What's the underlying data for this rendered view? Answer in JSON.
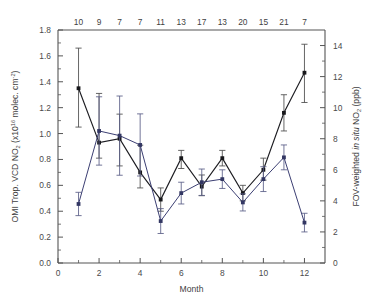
{
  "figure": {
    "xlabel": "Month",
    "left_axis_title_parts": {
      "p1": "OMI Trop. VCD NO",
      "sub1": "2",
      "p2": " (x10",
      "sup1": "16",
      "p3": " molec. cm",
      "sup2": "-2",
      "p4": ")"
    },
    "right_axis_title_parts": {
      "p1": "FOV-weighted ",
      "ital": "in situ",
      "p2": " NO",
      "sub1": "2",
      "p3": " (ppb)"
    },
    "colors": {
      "series_a": "#17171b",
      "series_b": "#333763",
      "axis": "#555555",
      "background": "#ffffff"
    }
  },
  "chart_data": {
    "type": "line",
    "title": "",
    "xlabel": "Month",
    "ylabel": "OMI Trop. VCD NO2 (x10^16 molec. cm^-2)",
    "y2label": "FOV-weighted in situ NO2 (ppb)",
    "grid": false,
    "legend": "none",
    "x": [
      1,
      2,
      3,
      4,
      5,
      6,
      7,
      8,
      9,
      10,
      11,
      12
    ],
    "xlim": [
      0,
      13
    ],
    "xticks": [
      0,
      2,
      4,
      6,
      8,
      10,
      12
    ],
    "xticklabels": [
      "0",
      "2",
      "4",
      "6",
      "8",
      "10",
      "12"
    ],
    "ylim": [
      0.0,
      1.8
    ],
    "yticks": [
      0.0,
      0.2,
      0.4,
      0.6,
      0.8,
      1.0,
      1.2,
      1.4,
      1.6,
      1.8
    ],
    "yticklabels": [
      "0.0",
      "0.2",
      "0.4",
      "0.6",
      "0.8",
      "1.0",
      "1.2",
      "1.4",
      "1.6",
      "1.8"
    ],
    "y2lim": [
      0,
      15
    ],
    "y2ticks": [
      0,
      2,
      4,
      6,
      8,
      10,
      12,
      14
    ],
    "y2ticklabels": [
      "0",
      "2",
      "4",
      "6",
      "8",
      "10",
      "12",
      "14"
    ],
    "top_axis_label": "number of observations",
    "top_axis_values": [
      10,
      9,
      7,
      7,
      11,
      13,
      17,
      13,
      20,
      15,
      21,
      7
    ],
    "series": [
      {
        "name": "OMI Trop. VCD NO2",
        "axis": "left",
        "color": "#17171b",
        "marker": "square",
        "values": [
          1.35,
          0.93,
          0.96,
          0.7,
          0.49,
          0.81,
          0.59,
          0.81,
          0.54,
          0.72,
          1.16,
          1.47
        ],
        "err_low": [
          0.3,
          0.12,
          0.21,
          0.12,
          0.09,
          0.08,
          0.07,
          0.06,
          0.06,
          0.08,
          0.14,
          0.23
        ],
        "err_high": [
          0.31,
          0.38,
          0.19,
          0.21,
          0.09,
          0.06,
          0.09,
          0.06,
          0.06,
          0.09,
          0.14,
          0.22
        ]
      },
      {
        "name": "FOV-weighted in situ NO2",
        "axis": "right",
        "color": "#333763",
        "marker": "square",
        "values": [
          3.8,
          8.5,
          8.2,
          7.6,
          2.7,
          4.5,
          5.2,
          5.4,
          3.9,
          5.4,
          6.8,
          2.6
        ],
        "err_low": [
          0.75,
          2.2,
          2.55,
          2.0,
          0.8,
          0.7,
          0.85,
          0.6,
          0.55,
          0.8,
          0.8,
          0.6
        ],
        "err_high": [
          0.75,
          2.2,
          2.55,
          2.0,
          0.8,
          0.7,
          0.85,
          0.6,
          0.55,
          0.8,
          0.8,
          0.6
        ]
      }
    ]
  }
}
